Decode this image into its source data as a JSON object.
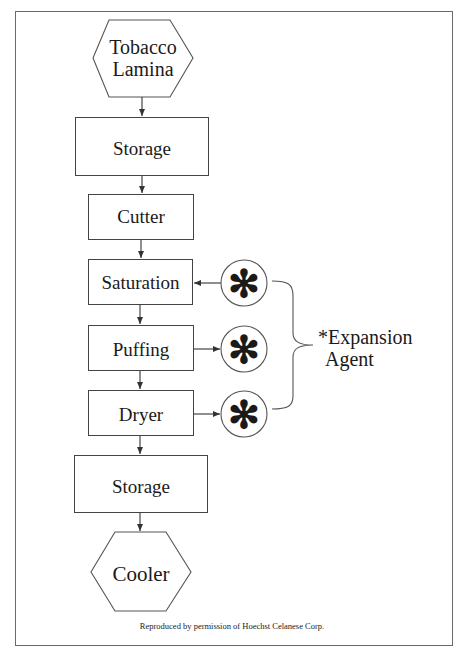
{
  "diagram": {
    "type": "process-flowchart",
    "nodes": [
      {
        "id": "tobacco-lamina",
        "shape": "hexagon",
        "label_line1": "Tobacco",
        "label_line2": "Lamina"
      },
      {
        "id": "storage-1",
        "shape": "rectangle",
        "label": "Storage"
      },
      {
        "id": "cutter",
        "shape": "rectangle",
        "label": "Cutter"
      },
      {
        "id": "saturation",
        "shape": "rectangle",
        "label": "Saturation"
      },
      {
        "id": "puffing",
        "shape": "rectangle",
        "label": "Puffing"
      },
      {
        "id": "dryer",
        "shape": "rectangle",
        "label": "Dryer"
      },
      {
        "id": "storage-2",
        "shape": "rectangle",
        "label": "Storage"
      },
      {
        "id": "cooler",
        "shape": "hexagon",
        "label": "Cooler"
      }
    ],
    "agents": [
      {
        "symbol": "✻",
        "connects_to": "saturation",
        "direction": "agent-to-process"
      },
      {
        "symbol": "✻",
        "connects_to": "puffing",
        "direction": "process-to-agent"
      },
      {
        "symbol": "✻",
        "connects_to": "dryer",
        "direction": "process-to-agent"
      }
    ],
    "edges": [
      [
        "tobacco-lamina",
        "storage-1"
      ],
      [
        "storage-1",
        "cutter"
      ],
      [
        "cutter",
        "saturation"
      ],
      [
        "saturation",
        "puffing"
      ],
      [
        "puffing",
        "dryer"
      ],
      [
        "dryer",
        "storage-2"
      ],
      [
        "storage-2",
        "cooler"
      ]
    ],
    "legend": {
      "line1": "*Expansion",
      "line2": "Agent"
    },
    "caption": "Reproduced by permission of Hoechst Celanese Corp.",
    "colors": {
      "stroke": "#444444",
      "text": "#1a1a1a",
      "frame": "#6a6a6a",
      "background": "#ffffff"
    }
  }
}
